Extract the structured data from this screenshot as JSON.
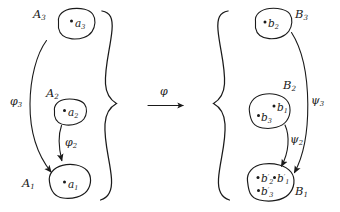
{
  "figure": {
    "kind": "commutative-diagram",
    "background_color": "#ffffff",
    "ink_color": "#1a1a1a"
  },
  "left_system": {
    "name": "A-system",
    "sets": [
      {
        "id": "A3",
        "label": "A",
        "sub": "3",
        "elements": [
          {
            "label": "a",
            "sub": "3",
            "prime": ""
          }
        ]
      },
      {
        "id": "A2",
        "label": "A",
        "sub": "2",
        "elements": [
          {
            "label": "a",
            "sub": "2",
            "prime": ""
          }
        ]
      },
      {
        "id": "A1",
        "label": "A",
        "sub": "1",
        "elements": [
          {
            "label": "a",
            "sub": "1",
            "prime": ""
          }
        ]
      }
    ],
    "maps": [
      {
        "id": "phi3",
        "label": "φ",
        "sub": "3",
        "from": "A3",
        "to": "A1"
      },
      {
        "id": "phi2",
        "label": "φ",
        "sub": "2",
        "from": "A2",
        "to": "A1"
      }
    ]
  },
  "right_system": {
    "name": "B-system",
    "sets": [
      {
        "id": "B3",
        "label": "B",
        "sub": "3",
        "elements": [
          {
            "label": "b",
            "sub": "2",
            "prime": ""
          }
        ]
      },
      {
        "id": "B2",
        "label": "B",
        "sub": "2",
        "elements": [
          {
            "label": "b",
            "sub": "1",
            "prime": ""
          },
          {
            "label": "b",
            "sub": "3",
            "prime": ""
          }
        ]
      },
      {
        "id": "B1",
        "label": "B",
        "sub": "1",
        "elements": [
          {
            "label": "b",
            "sub": "2",
            "prime": "′"
          },
          {
            "label": "b",
            "sub": "1",
            "prime": "′"
          },
          {
            "label": "b",
            "sub": "3",
            "prime": "′"
          }
        ]
      }
    ],
    "maps": [
      {
        "id": "psi3",
        "label": "ψ",
        "sub": "3",
        "from": "B3",
        "to": "B1"
      },
      {
        "id": "psi2",
        "label": "ψ",
        "sub": "2",
        "from": "B2",
        "to": "B1"
      }
    ]
  },
  "middle_arrow": {
    "id": "phi",
    "label": "φ",
    "direction": "right"
  },
  "braces": {
    "left": {
      "orientation": "right-closing"
    },
    "right": {
      "orientation": "left-opening"
    }
  },
  "text": {
    "A3": "A",
    "A3sub": "3",
    "A2": "A",
    "A2sub": "2",
    "A1": "A",
    "A1sub": "1",
    "a3": "a",
    "a3sub": "3",
    "a2": "a",
    "a2sub": "2",
    "a1": "a",
    "a1sub": "1",
    "phi3": "φ",
    "phi3sub": "3",
    "phi2": "φ",
    "phi2sub": "2",
    "phi": "φ",
    "B3": "B",
    "B3sub": "3",
    "B2": "B",
    "B2sub": "2",
    "B1": "B",
    "B1sub": "1",
    "b2": "b",
    "b2sub": "2",
    "b1": "b",
    "b1sub": "1",
    "b3": "b",
    "b3sub": "3",
    "b2p": "b",
    "b2psub": "2",
    "b2pprime": "′",
    "b1p": "b",
    "b1psub": "1",
    "b1pprime": "′",
    "b3p": "b",
    "b3psub": "3",
    "b3pprime": "′",
    "psi3": "ψ",
    "psi3sub": "3",
    "psi2": "ψ",
    "psi2sub": "2"
  }
}
